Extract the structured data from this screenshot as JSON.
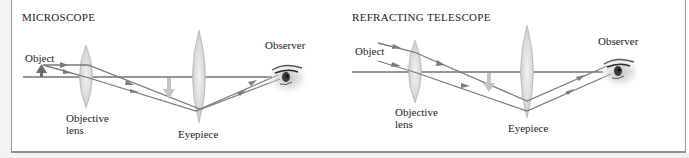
{
  "panels": [
    {
      "id": "microscope",
      "title": "MICROSCOPE",
      "labels": {
        "object": "Object",
        "objective_lens_line1": "Objective",
        "objective_lens_line2": "lens",
        "eyepiece": "Eyepiece",
        "observer": "Observer"
      }
    },
    {
      "id": "refracting-telescope",
      "title": "REFRACTING TELESCOPE",
      "labels": {
        "object": "Object",
        "objective_lens_line1": "Objective",
        "objective_lens_line2": "lens",
        "eyepiece": "Eyepiece",
        "observer": "Observer"
      }
    }
  ],
  "colors": {
    "axis": "#2a2a2a",
    "ray": "#7a7a7a",
    "lens_fill": "#dcdcdc",
    "lens_edge": "#a8a8a8",
    "object_arrow": "#6b6b6b",
    "image_arrow": "#c4c4c4",
    "frame_border": "#9a9a9a"
  }
}
